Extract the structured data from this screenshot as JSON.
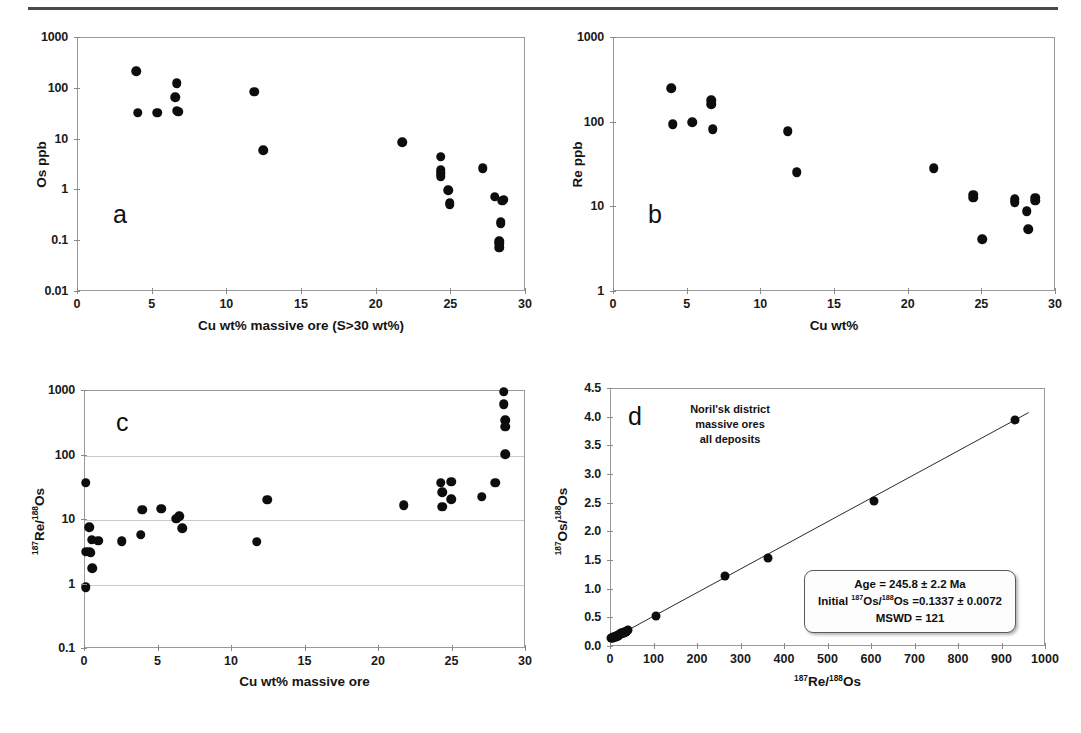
{
  "figure": {
    "panels": [
      {
        "letter": "a",
        "xlabel": "Cu wt% massive ore (S>30 wt%)",
        "ylabel": "Os ppb",
        "xticks": [
          "0",
          "5",
          "10",
          "15",
          "20",
          "25",
          "30"
        ],
        "yticks": [
          "1000",
          "100",
          "10",
          "1",
          "0.1",
          "0.01"
        ]
      },
      {
        "letter": "b",
        "xlabel": "Cu wt%",
        "ylabel": "Re ppb",
        "xticks": [
          "0",
          "5",
          "10",
          "15",
          "20",
          "25",
          "30"
        ],
        "yticks": [
          "1000",
          "100",
          "10",
          "1"
        ]
      },
      {
        "letter": "c",
        "xlabel": "Cu wt% massive ore",
        "ylabel_prefix": "187",
        "ylabel_mid": "Re/",
        "ylabel_sup2": "188",
        "ylabel_suffix": "Os",
        "xticks": [
          "0",
          "5",
          "10",
          "15",
          "20",
          "25",
          "30"
        ],
        "yticks": [
          "1000",
          "100",
          "10",
          "1",
          "0.1"
        ]
      },
      {
        "letter": "d",
        "xticks": [
          "0",
          "100",
          "200",
          "300",
          "400",
          "500",
          "600",
          "700",
          "800",
          "900",
          "1000"
        ],
        "yticks": [
          "4.5",
          "4.0",
          "3.5",
          "3.0",
          "2.5",
          "2.0",
          "1.5",
          "1.0",
          "0.5",
          "0.0"
        ],
        "annotation": [
          "Noril'sk district",
          "massive ores",
          "all deposits"
        ],
        "stats": {
          "age_line": "Age = 245.8 ± 2.2 Ma",
          "initial_prefix": "Initial ",
          "initial_sup1": "187",
          "initial_mid": "Os/",
          "initial_sup2": "188",
          "initial_suffix": "Os =0.1337 ± 0.0072",
          "mswd_line": "MSWD = 121"
        }
      }
    ]
  },
  "chart_data": [
    {
      "id": "panel-a",
      "type": "scatter",
      "title": "a",
      "xlabel": "Cu wt% massive ore (S>30 wt%)",
      "ylabel": "Os ppb",
      "xlim": [
        0,
        30
      ],
      "ylim": [
        0.01,
        1000
      ],
      "yscale": "log",
      "xscale": "linear",
      "grid": false,
      "xticks": [
        0,
        5,
        10,
        15,
        20,
        25,
        30
      ],
      "yticks": [
        0.01,
        0.1,
        1,
        10,
        100,
        1000
      ],
      "points": [
        {
          "x": 3.9,
          "y": 220
        },
        {
          "x": 4.0,
          "y": 34
        },
        {
          "x": 5.3,
          "y": 34
        },
        {
          "x": 6.6,
          "y": 130
        },
        {
          "x": 6.5,
          "y": 68
        },
        {
          "x": 6.6,
          "y": 37
        },
        {
          "x": 6.7,
          "y": 35
        },
        {
          "x": 11.8,
          "y": 88
        },
        {
          "x": 12.4,
          "y": 6.2
        },
        {
          "x": 21.7,
          "y": 8.8
        },
        {
          "x": 24.3,
          "y": 4.6
        },
        {
          "x": 24.3,
          "y": 2.5
        },
        {
          "x": 24.3,
          "y": 2.2
        },
        {
          "x": 24.3,
          "y": 1.9
        },
        {
          "x": 24.8,
          "y": 1.0
        },
        {
          "x": 24.9,
          "y": 0.57
        },
        {
          "x": 24.9,
          "y": 0.52
        },
        {
          "x": 27.1,
          "y": 2.7
        },
        {
          "x": 27.9,
          "y": 0.75
        },
        {
          "x": 28.5,
          "y": 0.66
        },
        {
          "x": 28.4,
          "y": 0.62
        },
        {
          "x": 28.3,
          "y": 0.24
        },
        {
          "x": 28.3,
          "y": 0.22
        },
        {
          "x": 28.2,
          "y": 0.1
        },
        {
          "x": 28.2,
          "y": 0.09
        },
        {
          "x": 28.2,
          "y": 0.075
        }
      ]
    },
    {
      "id": "panel-b",
      "type": "scatter",
      "title": "b",
      "xlabel": "Cu wt%",
      "ylabel": "Re ppb",
      "xlim": [
        0,
        30
      ],
      "ylim": [
        1,
        1000
      ],
      "yscale": "log",
      "xscale": "linear",
      "grid": false,
      "xticks": [
        0,
        5,
        10,
        15,
        20,
        25,
        30
      ],
      "yticks": [
        1,
        10,
        100,
        1000
      ],
      "points": [
        {
          "x": 3.9,
          "y": 255
        },
        {
          "x": 4.0,
          "y": 96
        },
        {
          "x": 5.3,
          "y": 101
        },
        {
          "x": 6.6,
          "y": 185
        },
        {
          "x": 6.6,
          "y": 165
        },
        {
          "x": 6.7,
          "y": 84
        },
        {
          "x": 11.8,
          "y": 79
        },
        {
          "x": 12.4,
          "y": 26
        },
        {
          "x": 21.7,
          "y": 29
        },
        {
          "x": 24.4,
          "y": 14
        },
        {
          "x": 24.4,
          "y": 13
        },
        {
          "x": 25.0,
          "y": 4.2
        },
        {
          "x": 27.2,
          "y": 12.5
        },
        {
          "x": 27.2,
          "y": 11.5
        },
        {
          "x": 28.0,
          "y": 9.0
        },
        {
          "x": 28.1,
          "y": 5.5
        },
        {
          "x": 28.6,
          "y": 13
        },
        {
          "x": 28.6,
          "y": 12
        }
      ]
    },
    {
      "id": "panel-c",
      "type": "scatter",
      "title": "c",
      "xlabel": "Cu wt% massive ore",
      "ylabel": "187Re/188Os",
      "xlim": [
        0,
        30
      ],
      "ylim": [
        0.1,
        1000
      ],
      "yscale": "log",
      "xscale": "linear",
      "grid": true,
      "xticks": [
        0,
        5,
        10,
        15,
        20,
        25,
        30
      ],
      "yticks": [
        0.1,
        1,
        10,
        100,
        1000
      ],
      "points": [
        {
          "x": 0.05,
          "y": 38
        },
        {
          "x": 0.3,
          "y": 7.7
        },
        {
          "x": 0.45,
          "y": 4.9
        },
        {
          "x": 0.9,
          "y": 4.8
        },
        {
          "x": 0.05,
          "y": 3.2
        },
        {
          "x": 0.3,
          "y": 3.2
        },
        {
          "x": 0.4,
          "y": 3.1
        },
        {
          "x": 0.5,
          "y": 1.8
        },
        {
          "x": 0.05,
          "y": 0.9
        },
        {
          "x": 2.5,
          "y": 4.7
        },
        {
          "x": 3.9,
          "y": 14.5
        },
        {
          "x": 3.8,
          "y": 5.9
        },
        {
          "x": 5.2,
          "y": 15
        },
        {
          "x": 6.2,
          "y": 10.5
        },
        {
          "x": 6.4,
          "y": 11.5
        },
        {
          "x": 6.6,
          "y": 7.4
        },
        {
          "x": 11.7,
          "y": 4.6
        },
        {
          "x": 12.4,
          "y": 20.5
        },
        {
          "x": 21.7,
          "y": 17
        },
        {
          "x": 24.2,
          "y": 38
        },
        {
          "x": 24.9,
          "y": 39
        },
        {
          "x": 24.3,
          "y": 27
        },
        {
          "x": 24.3,
          "y": 16
        },
        {
          "x": 24.9,
          "y": 21
        },
        {
          "x": 27.0,
          "y": 23
        },
        {
          "x": 27.9,
          "y": 38
        },
        {
          "x": 28.5,
          "y": 980
        },
        {
          "x": 28.5,
          "y": 620
        },
        {
          "x": 28.6,
          "y": 350
        },
        {
          "x": 28.6,
          "y": 280
        },
        {
          "x": 28.6,
          "y": 105
        }
      ]
    },
    {
      "id": "panel-d",
      "type": "scatter",
      "title": "d",
      "xlabel": "187Re/188Os",
      "ylabel": "187Os/188Os",
      "xlim": [
        0,
        1000
      ],
      "ylim": [
        0.0,
        4.5
      ],
      "xscale": "linear",
      "yscale": "linear",
      "grid": false,
      "xticks": [
        0,
        100,
        200,
        300,
        400,
        500,
        600,
        700,
        800,
        900,
        1000
      ],
      "yticks": [
        0.0,
        0.5,
        1.0,
        1.5,
        2.0,
        2.5,
        3.0,
        3.5,
        4.0,
        4.5
      ],
      "points": [
        {
          "x": 1,
          "y": 0.15
        },
        {
          "x": 3,
          "y": 0.16
        },
        {
          "x": 4,
          "y": 0.15
        },
        {
          "x": 5,
          "y": 0.17
        },
        {
          "x": 7,
          "y": 0.17
        },
        {
          "x": 9,
          "y": 0.18
        },
        {
          "x": 11,
          "y": 0.18
        },
        {
          "x": 12,
          "y": 0.19
        },
        {
          "x": 14,
          "y": 0.19
        },
        {
          "x": 15,
          "y": 0.2
        },
        {
          "x": 16,
          "y": 0.2
        },
        {
          "x": 17,
          "y": 0.21
        },
        {
          "x": 18,
          "y": 0.21
        },
        {
          "x": 20,
          "y": 0.22
        },
        {
          "x": 21,
          "y": 0.22
        },
        {
          "x": 23,
          "y": 0.23
        },
        {
          "x": 24,
          "y": 0.24
        },
        {
          "x": 26,
          "y": 0.24
        },
        {
          "x": 27,
          "y": 0.25
        },
        {
          "x": 29,
          "y": 0.25
        },
        {
          "x": 31,
          "y": 0.26
        },
        {
          "x": 33,
          "y": 0.27
        },
        {
          "x": 35,
          "y": 0.27
        },
        {
          "x": 37,
          "y": 0.28
        },
        {
          "x": 39,
          "y": 0.29
        },
        {
          "x": 104,
          "y": 0.54
        },
        {
          "x": 262,
          "y": 1.23
        },
        {
          "x": 360,
          "y": 1.55
        },
        {
          "x": 604,
          "y": 2.54
        },
        {
          "x": 928,
          "y": 3.96
        }
      ],
      "fit_line": {
        "intercept": 0.1337,
        "slope": 0.00412,
        "x_start": 0,
        "x_end": 960
      },
      "annotations": [
        "Noril'sk district",
        "massive ores",
        "all deposits"
      ],
      "stats_box": {
        "age": "Age = 245.8 ± 2.2 Ma",
        "initial": "Initial 187Os/188Os =0.1337 ± 0.0072",
        "mswd": "MSWD = 121"
      }
    }
  ],
  "colors": {
    "marker": "#0d0d0d",
    "frame": "#9a9a9a",
    "grid": "#c9c9c9",
    "text": "#111111",
    "rule": "#4a4a4a"
  }
}
